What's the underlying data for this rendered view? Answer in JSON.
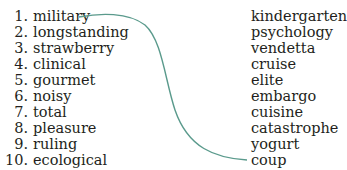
{
  "left_list": [
    {
      "num": "1.",
      "word": "military"
    },
    {
      "num": "2.",
      "word": "longstanding"
    },
    {
      "num": "3.",
      "word": "strawberry"
    },
    {
      "num": "4.",
      "word": "clinical"
    },
    {
      "num": "5.",
      "word": "gourmet"
    },
    {
      "num": "6.",
      "word": "noisy"
    },
    {
      "num": "7.",
      "word": "total"
    },
    {
      "num": "8.",
      "word": "pleasure"
    },
    {
      "num": "9.",
      "word": "ruling"
    },
    {
      "num": "10.",
      "word": "ecological"
    }
  ],
  "right_list": [
    "kindergarten",
    "psychology",
    "vendetta",
    "cruise",
    "elite",
    "embargo",
    "cuisine",
    "catastrophe",
    "yogurt",
    "coup"
  ],
  "connector": {
    "from": "military",
    "to": "coup",
    "color": "#5a9a8c"
  }
}
